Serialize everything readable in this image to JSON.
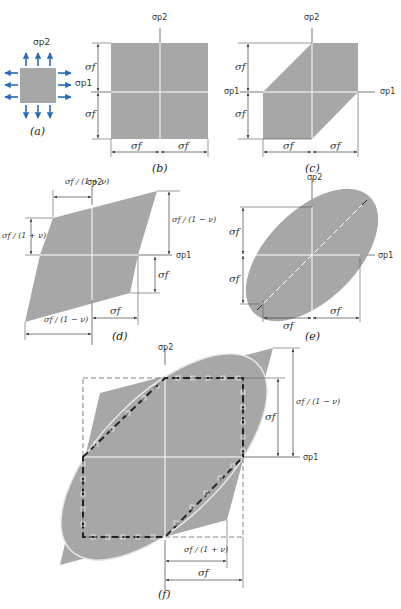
{
  "figure": {
    "colors": {
      "fill": "#a7a7a7",
      "axis": "#ffffff",
      "dim_line": "#444444",
      "arrow_blue": "#2a6ab5",
      "background": "#ffffff"
    },
    "panels": [
      {
        "id": "a",
        "caption": "(a)",
        "labels": {
          "axis_y": "σp2",
          "axis_x": "σp1"
        },
        "description": "Stressed square element with arrows"
      },
      {
        "id": "b",
        "caption": "(b)",
        "labels": {
          "axis_y": "σp2",
          "dim_v_top": "σf",
          "dim_v_bottom": "σf",
          "dim_h_left": "σf",
          "dim_h_right": "σf"
        },
        "description": "Maximum normal stress criterion (square)"
      },
      {
        "id": "c",
        "caption": "(c)",
        "labels": {
          "axis_y": "σp2",
          "axis_x_left": "σp1",
          "axis_x": "σp1",
          "dim_v_top": "σf",
          "dim_v_bottom": "σf",
          "dim_h_left": "σf",
          "dim_h_right": "σf"
        },
        "description": "Maximum shear stress (Tresca) hexagon"
      },
      {
        "id": "d",
        "caption": "(d)",
        "labels": {
          "axis_y": "σp2",
          "axis_x": "σp1",
          "dim_top": "σf / (1 + ν)",
          "dim_left": "σf / (1 + ν)",
          "dim_right": "σf / (1 − ν)",
          "dim_right_lower": "σf",
          "dim_bottom_right": "σf",
          "dim_bottom_left": "σf / (1 − ν)"
        },
        "description": "Maximum normal strain parallelogram"
      },
      {
        "id": "e",
        "caption": "(e)",
        "labels": {
          "axis_y": "σp2",
          "axis_x": "σp1",
          "dim_v_top": "σf",
          "dim_v_bottom": "σf",
          "dim_h_left": "σf",
          "dim_h_right": "σf"
        },
        "description": "Distortion energy (von Mises) ellipse"
      },
      {
        "id": "f",
        "caption": "(f)",
        "labels": {
          "axis_y": "σp2",
          "axis_x": "σp1",
          "dim_right_inner": "σf",
          "dim_right_outer": "σf / (1 − ν)",
          "dim_bottom_inner": "σf / (1 + ν)",
          "dim_bottom_outer": "σf"
        },
        "description": "Superposition of all criteria"
      }
    ]
  }
}
